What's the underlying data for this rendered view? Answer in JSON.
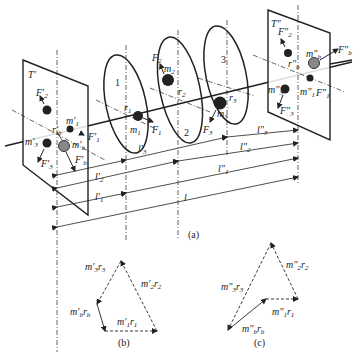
{
  "figure": {
    "panel_a": {
      "caption": "(a)",
      "left_plane": {
        "label": "T'",
        "masses": [
          "m'1",
          "m'3",
          "m'b"
        ],
        "forces": [
          "F'1",
          "F'2",
          "F'3",
          "F'b"
        ],
        "radius_label": "r'b"
      },
      "right_plane": {
        "label": "T''",
        "masses": [
          "m''1",
          "m''3",
          "m''b"
        ],
        "forces": [
          "F''1",
          "F''2",
          "F''3",
          "F''b"
        ],
        "radius_label": "r''b"
      },
      "discs": [
        {
          "number": "1",
          "mass": "m1",
          "radius": "r1",
          "force": "F1"
        },
        {
          "number": "2",
          "mass": "m2",
          "radius": "r2",
          "force": "F2"
        },
        {
          "number": "3",
          "mass": "m3",
          "radius": "r3",
          "force": "F3"
        }
      ],
      "dimensions": {
        "top_row": [
          "l'3",
          "l''3"
        ],
        "second_row": [
          "l'2",
          "l''2"
        ],
        "third_row": [
          "l'1",
          "l''1"
        ],
        "total": "l"
      }
    },
    "panel_b": {
      "caption": "(b)",
      "vectors": [
        "m'3 r3",
        "m'2 r2",
        "m'b rb",
        "m'1 r1"
      ]
    },
    "panel_c": {
      "caption": "(c)",
      "vectors": [
        "m''3 r3",
        "m''2 r2",
        "m''1 r1",
        "m''b rb"
      ]
    }
  },
  "text": {
    "T1": "T'",
    "T2": "T''",
    "d1": "1",
    "d2": "2",
    "d3": "3",
    "m1": "m",
    "m2": "m",
    "m3": "m",
    "cap_a": "(a)",
    "cap_b": "(b)",
    "cap_c": "(c)"
  }
}
